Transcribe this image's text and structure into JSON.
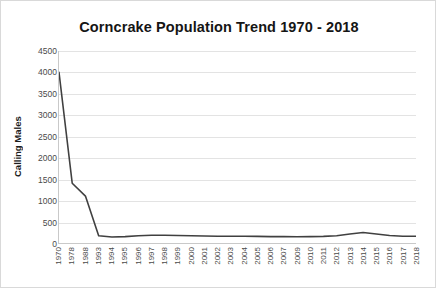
{
  "chart_data": {
    "type": "line",
    "title": "Corncrake Population Trend 1970 - 2018",
    "xlabel": "",
    "ylabel": "Calling Males",
    "ylim": [
      0,
      4500
    ],
    "ytick_step": 500,
    "yticks": [
      "4500",
      "4000",
      "3500",
      "3000",
      "2500",
      "2000",
      "1500",
      "1000",
      "500",
      "0"
    ],
    "grid": true,
    "legend": "none",
    "line_color": "#404040",
    "categories": [
      "1970",
      "1978",
      "1988",
      "1993",
      "1994",
      "1995",
      "1996",
      "1997",
      "1998",
      "1999",
      "2000",
      "2001",
      "2002",
      "2003",
      "2004",
      "2005",
      "2006",
      "2007",
      "2009",
      "2010",
      "2011",
      "2012",
      "2013",
      "2014",
      "2015",
      "2016",
      "2017",
      "2018"
    ],
    "values": [
      4000,
      1400,
      1100,
      170,
      140,
      150,
      170,
      180,
      180,
      175,
      170,
      165,
      160,
      160,
      160,
      155,
      150,
      150,
      145,
      150,
      155,
      170,
      210,
      245,
      210,
      175,
      160,
      160
    ],
    "series": [
      {
        "name": "Calling Males",
        "values": [
          4000,
          1400,
          1100,
          170,
          140,
          150,
          170,
          180,
          180,
          175,
          170,
          165,
          160,
          160,
          160,
          155,
          150,
          150,
          145,
          150,
          155,
          170,
          210,
          245,
          210,
          175,
          160,
          160
        ]
      }
    ]
  }
}
